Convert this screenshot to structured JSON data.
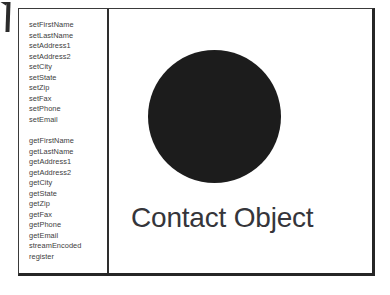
{
  "page": {
    "background_color": "#ffffff",
    "corner_mark": {
      "name": "page-crop-mark",
      "color": "#2b2b2b"
    }
  },
  "diagram": {
    "frame": {
      "border_color": "#3a3a3a",
      "shadow_color": "#262626"
    },
    "method_pane": {
      "divider_color": "#2e2e2e",
      "text_color": "#3d3d3d",
      "setters": [
        "setFirstName",
        "setLastName",
        "setAddress1",
        "setAddress2",
        "setCity",
        "setState",
        "setZip",
        "setFax",
        "setPhone",
        "setEmail"
      ],
      "getters": [
        "getFirstName",
        "getLastName",
        "getAddress1",
        "getAddress2",
        "getCity",
        "getState",
        "getZip",
        "getFax",
        "getPhone",
        "getEmail",
        "streamEncoded",
        "register"
      ]
    },
    "object_pane": {
      "shape": "filled-circle",
      "shape_color": "#1c1c1c",
      "label": "Contact Object",
      "label_color": "#35353a"
    }
  }
}
